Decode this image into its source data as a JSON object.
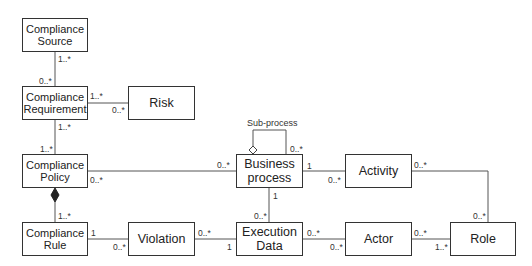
{
  "diagram": {
    "type": "UML class diagram",
    "classes": {
      "compliance_source": "Compliance\nSource",
      "compliance_requirement": "Compliance\nRequirement",
      "risk": "Risk",
      "compliance_policy": "Compliance\nPolicy",
      "compliance_rule": "Compliance\nRule",
      "violation": "Violation",
      "business_process": "Business\nprocess",
      "execution_data": "Execution\nData",
      "activity": "Activity",
      "actor": "Actor",
      "role": "Role"
    },
    "self_association_label": "Sub-process",
    "multiplicities": {
      "source_req_src": "1..*",
      "source_req_req": "0..*",
      "req_risk_req": "1..*",
      "req_risk_risk": "0..*",
      "req_policy_req": "1..*",
      "req_policy_policy": "1..*",
      "policy_bp_policy": "0..*",
      "policy_bp_bp": "0..*",
      "policy_rule_rule": "1..*",
      "rule_violation_rule": "1",
      "rule_violation_violation": "0..*",
      "violation_exec_violation": "0..*",
      "violation_exec_exec": "1",
      "bp_sub_bp": "0..*",
      "bp_activity_bp": "1",
      "bp_activity_activity": "0..*",
      "bp_exec_bp": "1",
      "bp_exec_exec": "0..*",
      "exec_actor_exec": "0..*",
      "exec_actor_actor": "0..*",
      "actor_role_actor": "0..*",
      "actor_role_role": "1..*",
      "activity_role_activity": "0..*",
      "activity_role_role": "0..*"
    },
    "relations": [
      {
        "from": "Compliance Source",
        "to": "Compliance Requirement",
        "kind": "association"
      },
      {
        "from": "Compliance Requirement",
        "to": "Risk",
        "kind": "association"
      },
      {
        "from": "Compliance Requirement",
        "to": "Compliance Policy",
        "kind": "association"
      },
      {
        "from": "Compliance Policy",
        "to": "Business process",
        "kind": "association"
      },
      {
        "from": "Compliance Policy",
        "to": "Compliance Rule",
        "kind": "composition"
      },
      {
        "from": "Compliance Rule",
        "to": "Violation",
        "kind": "association"
      },
      {
        "from": "Violation",
        "to": "Execution Data",
        "kind": "association"
      },
      {
        "from": "Business process",
        "to": "Business process",
        "kind": "aggregation",
        "label": "Sub-process"
      },
      {
        "from": "Business process",
        "to": "Activity",
        "kind": "association"
      },
      {
        "from": "Business process",
        "to": "Execution Data",
        "kind": "association"
      },
      {
        "from": "Execution Data",
        "to": "Actor",
        "kind": "association"
      },
      {
        "from": "Actor",
        "to": "Role",
        "kind": "association"
      },
      {
        "from": "Activity",
        "to": "Role",
        "kind": "association"
      }
    ],
    "colors": {
      "line": "#555555",
      "border": "#333333",
      "text": "#222222"
    }
  }
}
